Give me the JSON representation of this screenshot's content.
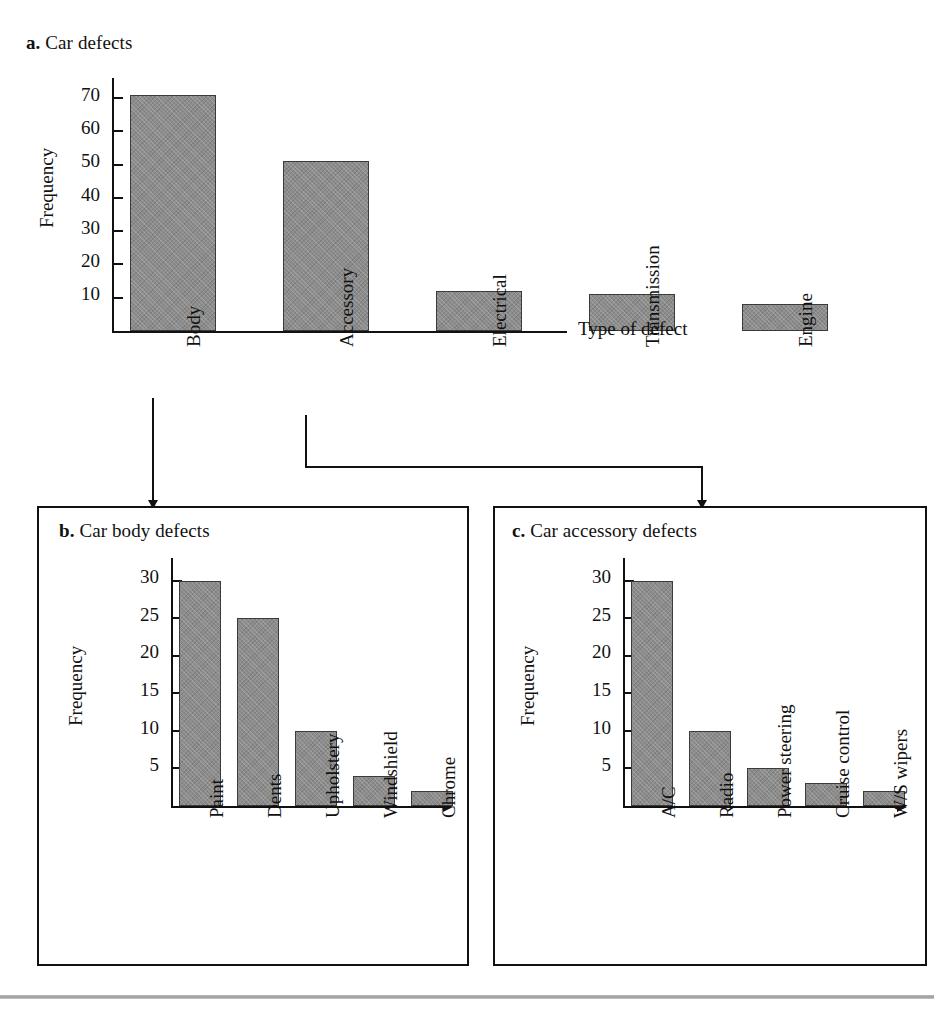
{
  "figure": {
    "background_color": "#ffffff",
    "bar_fill_color": "#8c8c8c",
    "bar_edge_color": "#3b3b3b",
    "axis_color": "#111111"
  },
  "panel_a": {
    "marker": "a.",
    "title": "Car defects",
    "ylabel": "Frequency",
    "xlabel": "Type of defect"
  },
  "panel_b": {
    "marker": "b.",
    "title": "Car body defects",
    "ylabel": "Frequency"
  },
  "panel_c": {
    "marker": "c.",
    "title": "Car accessory defects",
    "ylabel": "Frequency"
  },
  "connectors": [
    {
      "from": "Body",
      "to": "b. Car body defects",
      "shape": "straight-down-arrow"
    },
    {
      "from": "Accessory",
      "to": "c. Car accessory defects",
      "shape": "elbow-right-down-arrow"
    }
  ],
  "chart_data": [
    {
      "type": "bar",
      "id": "a",
      "title": "a. Car defects",
      "categories": [
        "Body",
        "Accessory",
        "Electrical",
        "Transmission",
        "Engine"
      ],
      "values": [
        71,
        51,
        12,
        11,
        8
      ],
      "xlabel": "Type of defect",
      "ylabel": "Frequency",
      "yticks": [
        10,
        20,
        30,
        40,
        50,
        60,
        70
      ],
      "ylim": [
        0,
        76
      ],
      "grid": false,
      "legend": null
    },
    {
      "type": "bar",
      "id": "b",
      "title": "b. Car body defects",
      "categories": [
        "Paint",
        "Dents",
        "Upholstery",
        "Windshield",
        "Chrome"
      ],
      "values": [
        30,
        25,
        10,
        4,
        2
      ],
      "xlabel": "",
      "ylabel": "Frequency",
      "yticks": [
        5,
        10,
        15,
        20,
        25,
        30
      ],
      "ylim": [
        0,
        33
      ],
      "grid": false,
      "legend": null
    },
    {
      "type": "bar",
      "id": "c",
      "title": "c. Car accessory defects",
      "categories": [
        "A/C",
        "Radio",
        "Power steering",
        "Cruise control",
        "W/S wipers"
      ],
      "values": [
        30,
        10,
        5,
        3,
        2
      ],
      "xlabel": "",
      "ylabel": "Frequency",
      "yticks": [
        5,
        10,
        15,
        20,
        25,
        30
      ],
      "ylim": [
        0,
        33
      ],
      "grid": false,
      "legend": null
    }
  ]
}
